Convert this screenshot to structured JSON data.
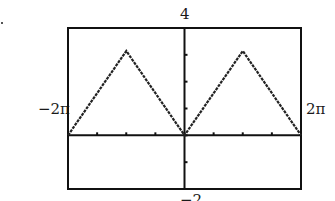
{
  "chart_data": {
    "type": "line",
    "title": "",
    "xlabel": "",
    "ylabel": "",
    "window": {
      "xmin_label": "−2π",
      "xmax_label": "2π",
      "ymax_label": "4",
      "ymin_label": "−2"
    },
    "xlim": [
      -6.2832,
      6.2832
    ],
    "ylim": [
      -2,
      4
    ],
    "x_tick_step": 1.5708,
    "y_tick_step": 1,
    "grid": false,
    "legend": null,
    "series": [
      {
        "name": "triangle wave",
        "x": [
          -6.2832,
          -3.1416,
          0,
          3.1416,
          6.2832
        ],
        "y": [
          0,
          3.1416,
          0,
          3.1416,
          0
        ]
      }
    ]
  }
}
